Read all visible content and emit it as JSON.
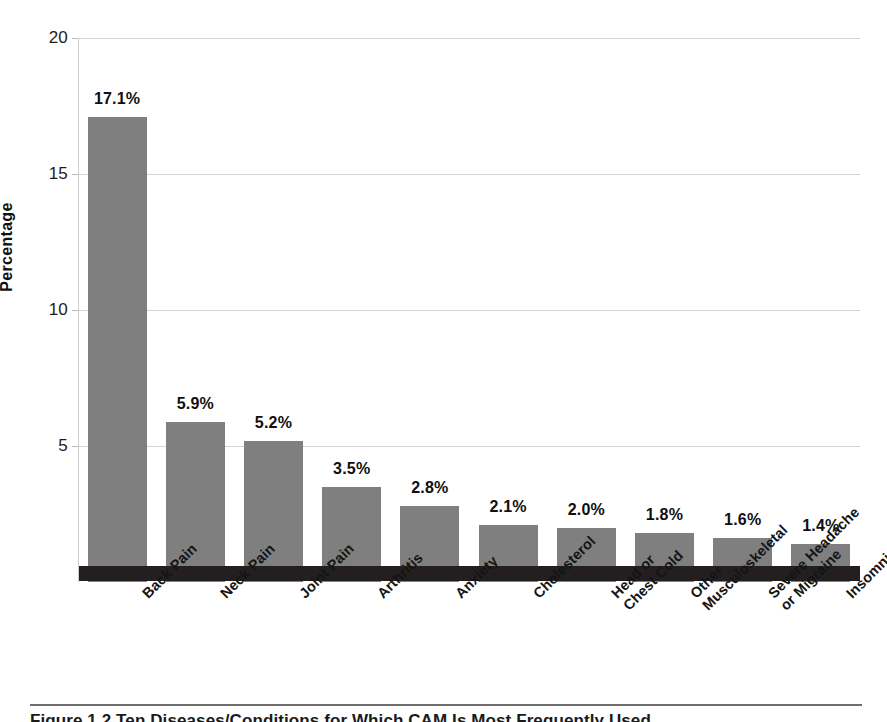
{
  "chart_data": {
    "type": "bar",
    "title": "",
    "subtitle": "",
    "xlabel": "",
    "ylabel": "Percentage",
    "ylim": [
      0,
      20
    ],
    "yticks": [
      5,
      10,
      15,
      20
    ],
    "ytick_labels": [
      "5",
      "10",
      "15",
      "20"
    ],
    "grid": true,
    "legend": "none",
    "orientation": "vertical",
    "bar_color": "#7f7f7f",
    "categories": [
      "Back Pain",
      "Neck Pain",
      "Joint Pain",
      "Arthritis",
      "Anxiety",
      "Cholesterol",
      "Head or\nChest Cold",
      "Other\nMusculoskeletal",
      "Severe Headache\nor Migraine",
      "Insomnia"
    ],
    "category_lines": [
      [
        "Back Pain"
      ],
      [
        "Neck Pain"
      ],
      [
        "Joint Pain"
      ],
      [
        "Arthritis"
      ],
      [
        "Anxiety"
      ],
      [
        "Cholesterol"
      ],
      [
        "Head or",
        "Chest Cold"
      ],
      [
        "Other",
        "Musculoskeletal"
      ],
      [
        "Severe Headache",
        "or Migraine"
      ],
      [
        "Insomnia"
      ]
    ],
    "values": [
      17.1,
      5.9,
      5.2,
      3.5,
      2.8,
      2.1,
      2.0,
      1.8,
      1.6,
      1.4
    ],
    "data_labels": [
      "17.1%",
      "5.9%",
      "5.2%",
      "3.5%",
      "2.8%",
      "2.1%",
      "2.0%",
      "1.8%",
      "1.6%",
      "1.4%"
    ]
  },
  "caption": {
    "rule_color": "#6e6e6e",
    "text": "Figure 1.2   Ten Diseases/Conditions for Which CAM Is Most Frequently Used"
  }
}
